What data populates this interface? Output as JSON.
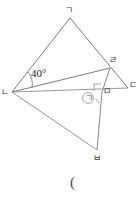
{
  "figure": {
    "type": "geometry-diagram",
    "background": "#ffffff",
    "stroke_color": "#6e6e6e",
    "text_color": "#3c3c3c",
    "width": 140,
    "height": 197,
    "points": {
      "g": {
        "label": "ㄱ",
        "x": 70,
        "y": 18
      },
      "n": {
        "label": "ㄴ",
        "x": 12,
        "y": 92
      },
      "d": {
        "label": "ㄷ",
        "x": 128,
        "y": 88
      },
      "r": {
        "label": "ㄹ",
        "x": 110,
        "y": 68
      },
      "m": {
        "label": "ㅁ",
        "x": 102,
        "y": 92
      },
      "b": {
        "label": "ㅂ",
        "x": 97,
        "y": 150
      }
    },
    "segments": [
      {
        "name": "g-n",
        "from": "g",
        "to": "n"
      },
      {
        "name": "g-d",
        "from": "g",
        "to": "d"
      },
      {
        "name": "n-d",
        "from": "n",
        "to": "d"
      },
      {
        "name": "n-r",
        "from": "n",
        "to": "r"
      },
      {
        "name": "r-m",
        "from": "r",
        "to": "m"
      },
      {
        "name": "m-b",
        "from": "m",
        "to": "b"
      },
      {
        "name": "n-b",
        "from": "n",
        "to": "b"
      }
    ],
    "angles": [
      {
        "name": "angle-at-n",
        "label": "40°",
        "vertex": "n",
        "x": 30,
        "y": 70
      },
      {
        "name": "angle-marked-unknown",
        "label": "ㄹ",
        "circled": true,
        "vertex": "m",
        "x": 84,
        "y": 94
      },
      {
        "name": "right-angle-at-m",
        "label": "",
        "vertex": "m"
      }
    ],
    "vertex_labels": {
      "g": {
        "text": "ㄱ",
        "x": 66,
        "y": 8
      },
      "n": {
        "text": "ㄴ",
        "x": 2,
        "y": 88
      },
      "d": {
        "text": "ㄷ",
        "x": 129,
        "y": 83
      },
      "r": {
        "text": "ㄹ",
        "x": 110,
        "y": 58
      },
      "m": {
        "text": "ㅁ",
        "x": 103,
        "y": 88
      },
      "b": {
        "text": "ㅂ",
        "x": 94,
        "y": 155
      }
    },
    "angle_texts": {
      "forty": "40°",
      "circled_mark": "ㄱ"
    },
    "footer_mark": {
      "text": "(",
      "x": 70,
      "y": 176
    }
  }
}
